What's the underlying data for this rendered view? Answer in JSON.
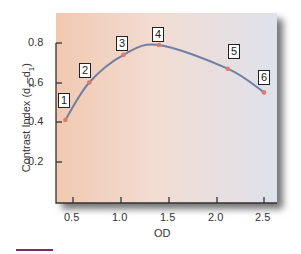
{
  "chart_data": {
    "type": "line",
    "title": "",
    "xlabel": "OD",
    "ylabel": "Contrast Index (d2–d1)",
    "ylabel_parts": {
      "prefix": "Contrast Index (d",
      "sub1": "2",
      "dash": "–d",
      "sub2": "1",
      "suffix": ")"
    },
    "xlim": [
      0.3,
      2.6
    ],
    "ylim": [
      0.0,
      0.9
    ],
    "x_ticks": [
      "0.5",
      "1.0",
      "1.5",
      "2.0",
      "2.5"
    ],
    "y_ticks": [
      "0.2",
      "0.4",
      "0.6",
      "0.8"
    ],
    "grid": false,
    "series": [
      {
        "name": "Contrast Index",
        "color": "#6f7fa6",
        "marker_color": "#e07a6a",
        "points": [
          {
            "label": "1",
            "x": 0.42,
            "y": 0.41
          },
          {
            "label": "2",
            "x": 0.67,
            "y": 0.6
          },
          {
            "label": "3",
            "x": 1.03,
            "y": 0.74
          },
          {
            "label": "4",
            "x": 1.4,
            "y": 0.79
          },
          {
            "label": "5",
            "x": 2.12,
            "y": 0.67
          },
          {
            "label": "6",
            "x": 2.5,
            "y": 0.55
          }
        ]
      }
    ]
  },
  "colors": {
    "accent_rule": "#7d2e6b"
  }
}
